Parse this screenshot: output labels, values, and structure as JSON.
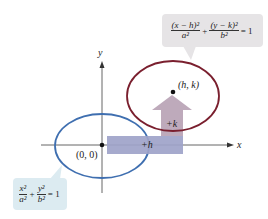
{
  "colors": {
    "blue_ellipse": "#3f6fb0",
    "red_ellipse": "#7a1f2e",
    "arrow_h_fill": "#9ea3c9",
    "arrow_v_fill": "#b8a3b5",
    "callout_top_bg": "#e6e4e6",
    "callout_bottom_bg": "#dcebf1",
    "axis": "#555555"
  },
  "axes": {
    "x_label": "x",
    "y_label": "y"
  },
  "points": {
    "origin": {
      "label": "(0, 0)"
    },
    "center": {
      "label": "(h, k)"
    }
  },
  "shifts": {
    "horizontal": "+h",
    "vertical": "+k"
  },
  "equations": {
    "shifted": {
      "term1_num": "(x − h)²",
      "term1_den": "a²",
      "plus": "+",
      "term2_num": "(y − k)²",
      "term2_den": "b²",
      "rhs": "= 1"
    },
    "standard": {
      "term1_num": "x²",
      "term1_den": "a²",
      "plus": "+",
      "term2_num": "y²",
      "term2_den": "b²",
      "rhs": "= 1"
    }
  }
}
